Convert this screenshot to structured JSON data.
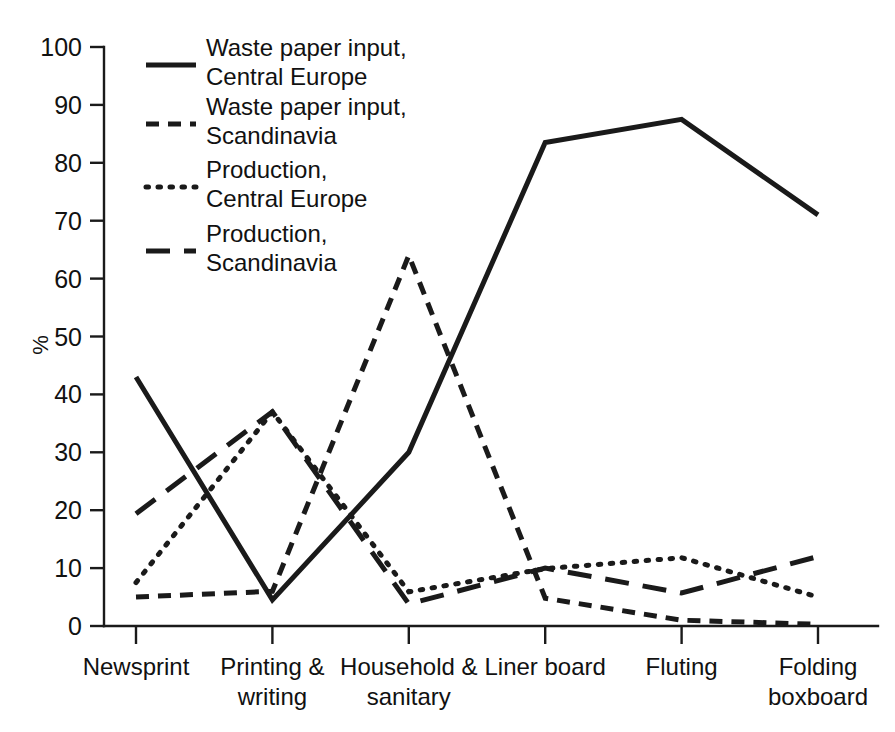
{
  "chart_data": {
    "type": "line",
    "title": "",
    "subtitle": "",
    "xlabel": "",
    "ylabel": "%",
    "ylim": [
      0,
      100
    ],
    "yticks": [
      0,
      10,
      20,
      30,
      40,
      50,
      60,
      70,
      80,
      90,
      100
    ],
    "ytick_labels": [
      "0",
      "10",
      "20",
      "30",
      "40",
      "50",
      "60",
      "70",
      "80",
      "90",
      "100"
    ],
    "grid": false,
    "legend_position": "upper-left-inside",
    "categories": [
      "Newsprint",
      "Printing &\nwriting",
      "Household &\nsanitary",
      "Liner board",
      "Fluting",
      "Folding\nboxboard"
    ],
    "category_lines": [
      [
        "Newsprint"
      ],
      [
        "Printing &",
        "writing"
      ],
      [
        "Household &",
        "sanitary"
      ],
      [
        "Liner board"
      ],
      [
        "Fluting"
      ],
      [
        "Folding",
        "boxboard"
      ]
    ],
    "series": [
      {
        "name": "Waste paper input,\nCentral Europe",
        "name_lines": [
          "Waste paper input,",
          "Central Europe"
        ],
        "style": "solid",
        "color": "#1a1a1a",
        "values": [
          43,
          4.5,
          30,
          83.5,
          87.5,
          71
        ]
      },
      {
        "name": "Waste paper input,\nScandinavia",
        "name_lines": [
          "Waste paper input,",
          "Scandinavia"
        ],
        "style": "dashed-short",
        "color": "#1a1a1a",
        "values": [
          5,
          6,
          64,
          4.8,
          1,
          0.3
        ]
      },
      {
        "name": "Production,\nCentral Europe",
        "name_lines": [
          "Production,",
          "Central Europe"
        ],
        "style": "dotted",
        "color": "#1a1a1a",
        "values": [
          7.5,
          37,
          5.9,
          9.9,
          11.8,
          5
        ]
      },
      {
        "name": "Production,\nScandinavia",
        "name_lines": [
          "Production,",
          "Scandinavia"
        ],
        "style": "dashed-long",
        "color": "#1a1a1a",
        "values": [
          19.4,
          37,
          3.8,
          10,
          5.7,
          12
        ]
      }
    ]
  },
  "legend": {
    "entries": [
      {
        "label_line1": "Waste paper input,",
        "label_line2": "Central Europe"
      },
      {
        "label_line1": "Waste paper input,",
        "label_line2": "Scandinavia"
      },
      {
        "label_line1": "Production,",
        "label_line2": "Central Europe"
      },
      {
        "label_line1": "Production,",
        "label_line2": "Scandinavia"
      }
    ]
  },
  "axes": {
    "y_title": "%",
    "y_labels": [
      "100",
      "90",
      "80",
      "70",
      "60",
      "50",
      "40",
      "30",
      "20",
      "10",
      "0"
    ],
    "x_labels": [
      {
        "line1": "Newsprint",
        "line2": ""
      },
      {
        "line1": "Printing &",
        "line2": "writing"
      },
      {
        "line1": "Household &",
        "line2": "sanitary"
      },
      {
        "line1": "Liner board",
        "line2": ""
      },
      {
        "line1": "Fluting",
        "line2": ""
      },
      {
        "line1": "Folding",
        "line2": "boxboard"
      }
    ]
  }
}
